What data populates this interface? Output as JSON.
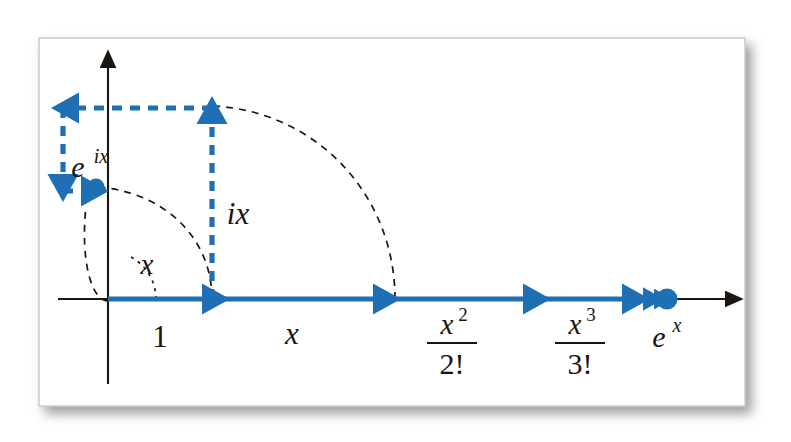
{
  "figure": {
    "background_color": "#ffffff",
    "frame": {
      "fill": "#ffffff",
      "border_color": "#c7d3dd",
      "shadow_color": "#9a9a95"
    },
    "colors": {
      "series_blue": "#1f6fb4",
      "axis_black": "#1d1510",
      "arc_dash": "#1d1510"
    }
  },
  "axes": {
    "origin": {
      "x": 108,
      "y": 299
    },
    "horizontal": {
      "label": "real-axis",
      "x_start": 58,
      "x_end": 737,
      "y": 299
    },
    "vertical": {
      "label": "imaginary-axis",
      "x": 108,
      "y_top": 57,
      "y_bottom": 384
    }
  },
  "real_series": {
    "name": "exponential series on real axis",
    "segments": [
      {
        "label": "1",
        "label_type": "plain",
        "numerator": "",
        "denominator": "",
        "x_start": 108,
        "x_end": 212,
        "label_x": 160,
        "label_y": 340
      },
      {
        "label": "x",
        "label_type": "italic",
        "numerator": "",
        "denominator": "",
        "x_start": 212,
        "x_end": 383,
        "label_x": 292,
        "label_y": 340
      },
      {
        "label": "",
        "label_type": "fraction",
        "numerator": "x2",
        "denominator": "2!",
        "x_start": 383,
        "x_end": 533,
        "label_x": 452,
        "label_y": 330
      },
      {
        "label": "",
        "label_type": "fraction",
        "numerator": "x3",
        "denominator": "3!",
        "x_start": 533,
        "x_end": 632,
        "label_x": 580,
        "label_y": 330
      }
    ],
    "tail_arrows": [
      {
        "x_start": 632,
        "x_end": 652
      },
      {
        "x_start": 652,
        "x_end": 661
      }
    ],
    "limit_point": {
      "label": "ex",
      "x": 667,
      "y": 299,
      "label_x": 667,
      "label_y": 343
    }
  },
  "complex_series": {
    "name": "rotating series converging to e^{ix}",
    "segments": [
      {
        "label": "ix",
        "label_x": 236,
        "label_y": 215,
        "from": {
          "x": 212,
          "y": 299
        },
        "to": {
          "x": 212,
          "y": 108
        },
        "direction": "up"
      },
      {
        "label": "",
        "label_x": 0,
        "label_y": 0,
        "from": {
          "x": 212,
          "y": 108
        },
        "to": {
          "x": 63,
          "y": 108
        },
        "direction": "left"
      },
      {
        "label": "",
        "label_x": 0,
        "label_y": 0,
        "from": {
          "x": 63,
          "y": 108
        },
        "to": {
          "x": 63,
          "y": 188
        },
        "direction": "down"
      },
      {
        "label": "",
        "label_x": 0,
        "label_y": 0,
        "from": {
          "x": 63,
          "y": 188
        },
        "to": {
          "x": 92,
          "y": 188
        },
        "direction": "right"
      }
    ],
    "limit_point": {
      "label": "eix",
      "x": 96,
      "y": 188,
      "label_x": 78,
      "label_y": 172
    }
  },
  "labels": {
    "one": "1",
    "x": "x",
    "ix": "ix",
    "e_to_x": "e",
    "e_to_x_exponent": "x",
    "e_to_ix": "e",
    "e_to_ix_exponent": "ix",
    "x_squared_num": "x",
    "x_squared_num_exp": "2",
    "x_squared_den": "2!",
    "x_cubed_num": "x",
    "x_cubed_num_exp": "3",
    "x_cubed_den": "3!",
    "angle": "x"
  },
  "arcs": {
    "angle_arc": {
      "name": "angle-x-arc",
      "label": "x",
      "label_x": 143,
      "label_y": 268,
      "radius": 48
    },
    "inner_arc": {
      "name": "unit-rotation-arc",
      "from": {
        "x": 212,
        "y": 299
      },
      "to": {
        "x": 96,
        "y": 188
      }
    },
    "outer_arc": {
      "name": "second-term-rotation-arc",
      "from": {
        "x": 395,
        "y": 299
      },
      "to": {
        "x": 214,
        "y": 106
      }
    },
    "small_arc": {
      "name": "third-term-rotation-arc",
      "from": {
        "x": 108,
        "y": 300
      },
      "to": {
        "x": 78,
        "y": 215
      }
    }
  }
}
